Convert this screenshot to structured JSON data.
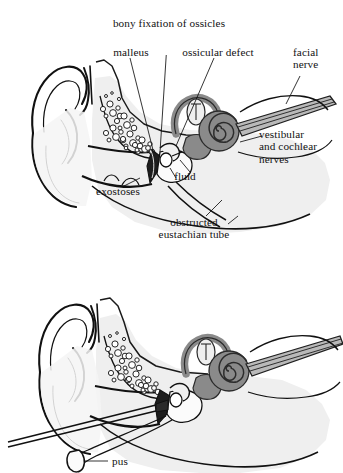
{
  "figure": {
    "title_implied": "Cross-section of the ear showing chronic otitis media complications",
    "panels": [
      {
        "id": "upper",
        "name": "upper-ear-cross-section",
        "labels": [
          {
            "key": "bony_fixation",
            "text": "bony fixation of ossicles",
            "lines": [
              "bony fixation of ossicles"
            ]
          },
          {
            "key": "malleus",
            "text": "malleus",
            "lines": [
              "malleus"
            ]
          },
          {
            "key": "ossicular_defect",
            "text": "ossicular defect",
            "lines": [
              "ossicular defect"
            ]
          },
          {
            "key": "facial_nerve",
            "text": "facial nerve",
            "lines": [
              "facial",
              "nerve"
            ]
          },
          {
            "key": "vestibular_cochlear",
            "text": "vestibular and cochlear nerves",
            "lines": [
              "vestibular",
              "and cochlear",
              "nerves"
            ]
          },
          {
            "key": "exostoses",
            "text": "exostoses",
            "lines": [
              "exostoses"
            ]
          },
          {
            "key": "fluid",
            "text": "fluid",
            "lines": [
              "fluid"
            ]
          },
          {
            "key": "obstructed_eustachian",
            "text": "obstructed eustachian tube",
            "lines": [
              "obstructed",
              "eustachian tube"
            ]
          }
        ]
      },
      {
        "id": "lower",
        "name": "lower-ear-cross-section",
        "labels": [
          {
            "key": "pus",
            "text": "pus",
            "lines": [
              "pus"
            ]
          }
        ]
      }
    ]
  },
  "labels": {
    "bony_fixation": "bony fixation of ossicles",
    "malleus": "malleus",
    "ossicular_defect": "ossicular defect",
    "facial_nerve_l1": "facial",
    "facial_nerve_l2": "nerve",
    "vestibular_l1": "vestibular",
    "vestibular_l2": "and cochlear",
    "vestibular_l3": "nerves",
    "exostoses": "exostoses",
    "fluid": "fluid",
    "eustachian_l1": "obstructed",
    "eustachian_l2": "eustachian tube",
    "pus": "pus"
  },
  "colors": {
    "background": "#ffffff",
    "ink": "#111111",
    "bone_fill": "#e9e9e9",
    "bone_fill_light": "#f2f2f2",
    "inner_ear_fill": "#8f8f8f",
    "inner_ear_dark": "#6f6f6f",
    "nerve_fill": "#b8b8b8",
    "eardrum_dark": "#1a1a1a",
    "air_cell_fill": "#ffffff"
  }
}
